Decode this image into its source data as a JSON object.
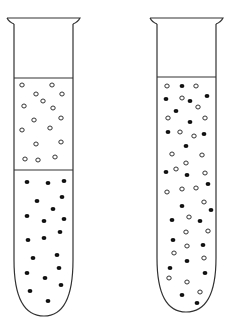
{
  "figure": {
    "colors": {
      "background": "#ffffff",
      "stroke": "#333333",
      "filled": "#111111"
    },
    "tubes": [
      {
        "name": "left-tube",
        "layers": [
          {
            "name": "upper-layer",
            "particle_type": "hollow"
          },
          {
            "name": "lower-layer",
            "particle_type": "filled"
          }
        ],
        "hollow": [
          [
            22,
            85
          ],
          [
            52,
            85
          ],
          [
            36,
            94
          ],
          [
            62,
            94
          ],
          [
            43,
            101
          ],
          [
            24,
            106
          ],
          [
            53,
            108
          ],
          [
            34,
            120
          ],
          [
            61,
            118
          ],
          [
            22,
            130
          ],
          [
            50,
            128
          ],
          [
            61,
            142
          ],
          [
            36,
            144
          ],
          [
            25,
            159
          ],
          [
            38,
            160
          ],
          [
            55,
            157
          ]
        ],
        "filled": [
          [
            27,
            182
          ],
          [
            48,
            183
          ],
          [
            64,
            181
          ],
          [
            62,
            197
          ],
          [
            37,
            201
          ],
          [
            53,
            209
          ],
          [
            27,
            216
          ],
          [
            44,
            221
          ],
          [
            64,
            219
          ],
          [
            60,
            232
          ],
          [
            28,
            240
          ],
          [
            44,
            238
          ],
          [
            33,
            258
          ],
          [
            57,
            255
          ],
          [
            59,
            268
          ],
          [
            27,
            273
          ],
          [
            45,
            278
          ],
          [
            61,
            285
          ],
          [
            30,
            291
          ],
          [
            48,
            301
          ]
        ]
      },
      {
        "name": "right-tube",
        "layers": [
          {
            "name": "mixed-layer",
            "particle_type": "mixed"
          }
        ],
        "hollow": [
          [
            167,
            86
          ],
          [
            196,
            86
          ],
          [
            182,
            98
          ],
          [
            198,
            107
          ],
          [
            168,
            118
          ],
          [
            205,
            118
          ],
          [
            180,
            132
          ],
          [
            194,
            136
          ],
          [
            172,
            154
          ],
          [
            202,
            155
          ],
          [
            186,
            163
          ],
          [
            176,
            169
          ],
          [
            205,
            173
          ],
          [
            167,
            192
          ],
          [
            182,
            189
          ],
          [
            196,
            188
          ],
          [
            204,
            202
          ],
          [
            189,
            217
          ],
          [
            186,
            232
          ],
          [
            208,
            231
          ],
          [
            187,
            246
          ],
          [
            174,
            253
          ],
          [
            204,
            258
          ],
          [
            169,
            278
          ],
          [
            187,
            282
          ],
          [
            200,
            292
          ]
        ],
        "filled": [
          [
            182,
            86
          ],
          [
            166,
            99
          ],
          [
            190,
            101
          ],
          [
            207,
            96
          ],
          [
            176,
            111
          ],
          [
            190,
            122
          ],
          [
            168,
            132
          ],
          [
            204,
            134
          ],
          [
            186,
            146
          ],
          [
            166,
            172
          ],
          [
            187,
            175
          ],
          [
            208,
            184
          ],
          [
            182,
            206
          ],
          [
            211,
            210
          ],
          [
            172,
            220
          ],
          [
            200,
            221
          ],
          [
            173,
            240
          ],
          [
            203,
            245
          ],
          [
            187,
            261
          ],
          [
            170,
            268
          ],
          [
            205,
            273
          ],
          [
            182,
            295
          ],
          [
            197,
            303
          ]
        ]
      }
    ]
  }
}
